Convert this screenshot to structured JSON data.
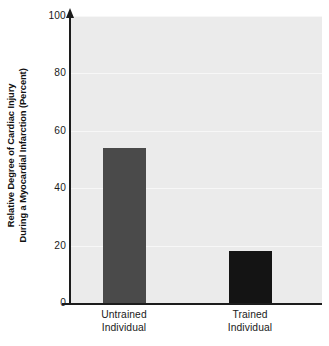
{
  "chart_data": {
    "type": "bar",
    "title": "",
    "subtitle": "",
    "xlabel": "",
    "ylabel_line1": "Relative Degree of Cardiac Injury",
    "ylabel_line2": "During a Myocardial Infarction (Percent)",
    "categories": [
      "Untrained Individual",
      "Trained Individual"
    ],
    "category_lines": [
      [
        "Untrained",
        "Individual"
      ],
      [
        "Trained",
        "Individual"
      ]
    ],
    "values": [
      54,
      18
    ],
    "bar_colors": [
      "#4a4a4a",
      "#141414"
    ],
    "ylim": [
      0,
      100
    ],
    "yticks": [
      0,
      20,
      40,
      60,
      80,
      100
    ],
    "ytick_labels": [
      "0",
      "20",
      "40",
      "60",
      "80",
      "100"
    ],
    "grid": true,
    "grid_axis": "y",
    "legend": false,
    "legend_position": "none",
    "plot_background": "#ebebeb",
    "page_background": "#ffffff",
    "axis_color": "#1c1c1c",
    "gridline_color": "#f7f7f7",
    "y_axis_has_arrow": true
  }
}
